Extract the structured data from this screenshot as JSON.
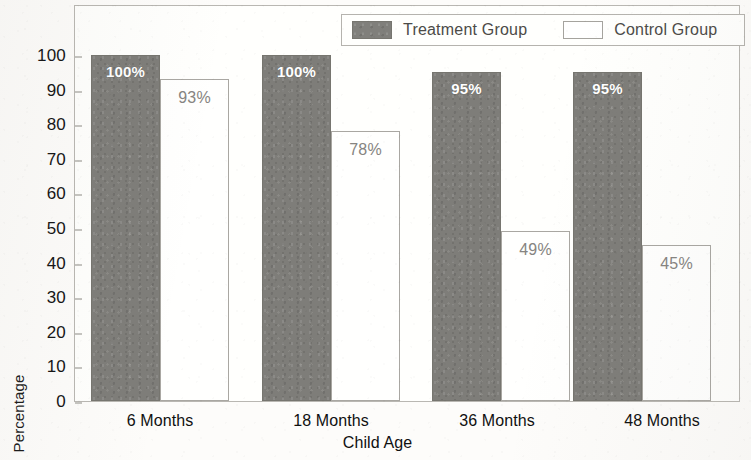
{
  "chart_data": {
    "type": "bar",
    "title": "",
    "xlabel": "Child Age",
    "ylabel": "Percentage",
    "categories": [
      "6 Months",
      "18 Months",
      "36 Months",
      "48 Months"
    ],
    "series": [
      {
        "name": "Treatment Group",
        "color": "#7e7d79",
        "values": [
          100,
          100,
          95,
          95
        ],
        "labels": [
          "100%",
          "100%",
          "95%",
          "95%"
        ]
      },
      {
        "name": "Control Group",
        "color": "#ffffff",
        "values": [
          93,
          78,
          49,
          45
        ],
        "labels": [
          "93%",
          "78%",
          "49%",
          "45%"
        ]
      }
    ],
    "ylim": [
      0,
      100
    ],
    "yticks": [
      0,
      10,
      20,
      30,
      40,
      50,
      60,
      70,
      80,
      90,
      100
    ],
    "ytick_labels": [
      "0",
      "10",
      "20",
      "30",
      "40",
      "50",
      "60",
      "70",
      "80",
      "90",
      "100"
    ],
    "grid": false,
    "legend_position": "top-right-inside"
  },
  "legend": {
    "entries": [
      {
        "label": "Treatment Group",
        "swatch": "filled-gray-swatch"
      },
      {
        "label": "Control Group",
        "swatch": "outlined-white-swatch"
      }
    ]
  }
}
